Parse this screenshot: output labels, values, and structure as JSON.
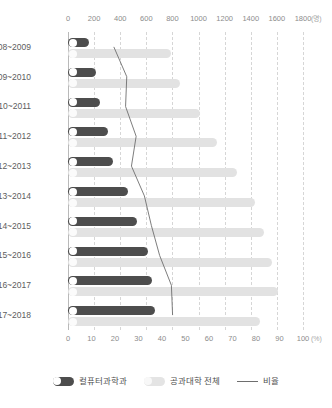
{
  "chart_data": {
    "type": "bar",
    "title": "",
    "subtitle": "",
    "xlabel": "",
    "ylabel": "",
    "orientation": "horizontal",
    "grid": true,
    "legend_position": "bottom",
    "categories": [
      "2008~2009",
      "2009~2010",
      "2010~2011",
      "2011~2012",
      "2012~2013",
      "2013~2014",
      "2014~2015",
      "2015~2016",
      "2016~2017",
      "2017~2018"
    ],
    "top_axis": {
      "unit": "(명)",
      "min": 0,
      "max": 1800,
      "ticks": [
        0,
        200,
        400,
        600,
        800,
        1000,
        1200,
        1400,
        1600,
        1800
      ],
      "tick_labels": [
        "0",
        "200",
        "400",
        "600",
        "800",
        "1000",
        "1200",
        "1400",
        "1600",
        "1800"
      ]
    },
    "bottom_axis": {
      "unit": "(%)",
      "min": 0,
      "max": 100,
      "ticks": [
        0,
        10,
        20,
        30,
        40,
        50,
        60,
        70,
        80,
        90,
        100
      ],
      "tick_labels": [
        "0",
        "10",
        "20",
        "30",
        "40",
        "50",
        "60",
        "70",
        "80",
        "90",
        "100"
      ]
    },
    "series": [
      {
        "name": "컬퓨터과학과",
        "key": "cs",
        "axis": "top",
        "color": "#4d4d4d",
        "values": [
          160,
          215,
          245,
          305,
          345,
          460,
          530,
          610,
          640,
          670
        ]
      },
      {
        "name": "공과대학 전체",
        "key": "engineering_total",
        "axis": "top",
        "color": "#e2e2e2",
        "values": [
          790,
          860,
          1010,
          1140,
          1295,
          1430,
          1500,
          1560,
          1610,
          1470
        ]
      },
      {
        "name": "비율",
        "key": "ratio",
        "axis": "bottom",
        "color": "#6e6e6e",
        "type": "line",
        "values": [
          19.5,
          25.0,
          24.5,
          29.0,
          27.0,
          32.5,
          35.5,
          39.0,
          44.0,
          44.5
        ]
      }
    ]
  },
  "legend": {
    "items": [
      {
        "label": "컬퓨터과학과",
        "marker": "pill-dark"
      },
      {
        "label": "공과대학 전체",
        "marker": "pill-light"
      },
      {
        "label": "비율",
        "marker": "line"
      }
    ]
  }
}
